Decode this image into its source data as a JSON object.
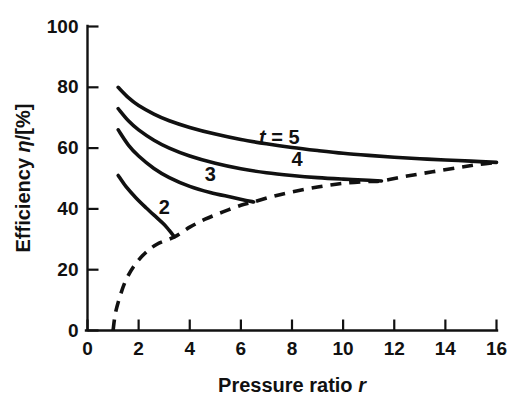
{
  "chart_data": {
    "type": "line",
    "title": "",
    "xlabel": "Pressure ratio r",
    "ylabel": "Efficiency η/[%]",
    "xlim": [
      0,
      16
    ],
    "ylim": [
      0,
      100
    ],
    "grid": false,
    "legend_position": "inline-curve-labels",
    "xticks": [
      0,
      2,
      4,
      6,
      8,
      10,
      12,
      14,
      16
    ],
    "xtick_labels": [
      "0",
      "2",
      "4",
      "6",
      "8",
      "10",
      "12",
      "14",
      "16"
    ],
    "yticks": [
      0,
      20,
      40,
      60,
      80,
      100
    ],
    "ytick_labels": [
      "0",
      "20",
      "40",
      "60",
      "80",
      "100"
    ],
    "series": [
      {
        "name": "t = 5",
        "label": "t = 5",
        "style": "solid",
        "label_x": 7.5,
        "label_y": 63,
        "points": [
          [
            1.2,
            80.0
          ],
          [
            1.6,
            76.6
          ],
          [
            2.0,
            74.0
          ],
          [
            2.6,
            71.2
          ],
          [
            3.2,
            69.0
          ],
          [
            4.0,
            66.8
          ],
          [
            5.0,
            64.6
          ],
          [
            6.0,
            62.8
          ],
          [
            7.0,
            61.4
          ],
          [
            8.0,
            60.2
          ],
          [
            9.0,
            59.2
          ],
          [
            10.0,
            58.3
          ],
          [
            11.0,
            57.6
          ],
          [
            12.0,
            57.0
          ],
          [
            13.0,
            56.5
          ],
          [
            14.0,
            56.1
          ],
          [
            15.0,
            55.7
          ],
          [
            16.0,
            55.3
          ]
        ]
      },
      {
        "name": "4",
        "label": "4",
        "style": "solid",
        "label_x": 8.2,
        "label_y": 56,
        "points": [
          [
            1.2,
            73.0
          ],
          [
            1.6,
            69.0
          ],
          [
            2.0,
            66.0
          ],
          [
            2.6,
            62.6
          ],
          [
            3.2,
            60.0
          ],
          [
            4.0,
            57.4
          ],
          [
            5.0,
            55.0
          ],
          [
            6.0,
            53.2
          ],
          [
            7.0,
            51.9
          ],
          [
            8.0,
            51.0
          ],
          [
            9.0,
            50.3
          ],
          [
            10.0,
            49.8
          ],
          [
            11.0,
            49.4
          ],
          [
            11.5,
            49.2
          ]
        ]
      },
      {
        "name": "3",
        "label": "3",
        "style": "solid",
        "label_x": 4.8,
        "label_y": 51,
        "points": [
          [
            1.2,
            66.0
          ],
          [
            1.6,
            61.0
          ],
          [
            2.0,
            57.4
          ],
          [
            2.6,
            53.3
          ],
          [
            3.2,
            50.3
          ],
          [
            4.0,
            47.4
          ],
          [
            4.8,
            45.4
          ],
          [
            5.6,
            43.9
          ],
          [
            6.2,
            42.8
          ],
          [
            6.5,
            42.3
          ]
        ]
      },
      {
        "name": "2",
        "label": "2",
        "style": "solid",
        "label_x": 3.0,
        "label_y": 40,
        "points": [
          [
            1.2,
            51.0
          ],
          [
            1.5,
            47.4
          ],
          [
            1.9,
            43.6
          ],
          [
            2.3,
            40.3
          ],
          [
            2.7,
            37.2
          ],
          [
            3.0,
            34.9
          ],
          [
            3.2,
            32.9
          ],
          [
            3.4,
            30.8
          ]
        ]
      },
      {
        "name": "envelope",
        "label": "",
        "style": "dashed",
        "label_x": null,
        "label_y": null,
        "points": [
          [
            1.0,
            0.0
          ],
          [
            1.1,
            6.0
          ],
          [
            1.3,
            12.0
          ],
          [
            1.5,
            16.5
          ],
          [
            1.8,
            21.0
          ],
          [
            2.2,
            25.0
          ],
          [
            2.7,
            28.3
          ],
          [
            3.4,
            30.8
          ],
          [
            4.0,
            34.0
          ],
          [
            4.6,
            36.6
          ],
          [
            5.3,
            39.0
          ],
          [
            6.0,
            41.2
          ],
          [
            6.5,
            42.3
          ],
          [
            7.2,
            44.0
          ],
          [
            8.0,
            45.6
          ],
          [
            9.0,
            47.2
          ],
          [
            10.0,
            48.4
          ],
          [
            11.0,
            49.0
          ],
          [
            11.5,
            49.2
          ],
          [
            12.5,
            50.8
          ],
          [
            13.5,
            52.2
          ],
          [
            14.5,
            53.6
          ],
          [
            15.3,
            54.6
          ],
          [
            16.0,
            55.3
          ]
        ]
      }
    ]
  },
  "axes": {
    "x_title": "Pressure ratio r",
    "x_title_plain": "Pressure ratio",
    "x_title_symbol": "r",
    "y_title": "Efficiency η/[%]",
    "y_title_plain_pre": "Efficiency ",
    "y_title_symbol": "η",
    "y_title_plain_post": "/[%]"
  },
  "colors": {
    "ink": "#111111",
    "background": "#ffffff"
  }
}
